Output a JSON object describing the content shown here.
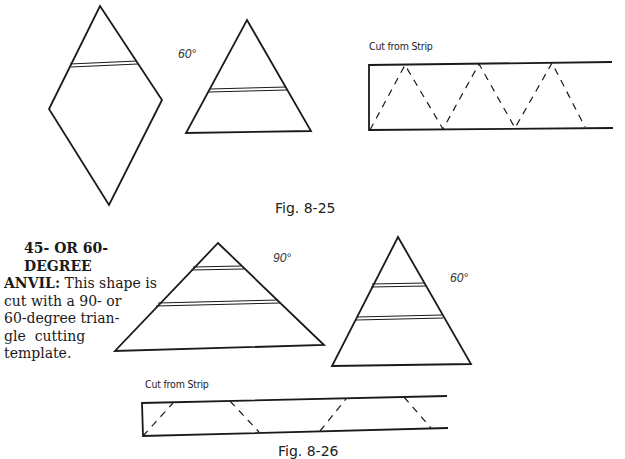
{
  "figure_top": {
    "angle_label": "60°",
    "strip_title": "Cut from Strip",
    "caption": "Fig. 8-25"
  },
  "figure_bottom": {
    "angle_label_left": "90°",
    "angle_label_right": "60°",
    "strip_title": "Cut from Strip",
    "caption": "Fig. 8-26"
  },
  "text": {
    "heading": "45- OR 60-DEGREE",
    "lead": "ANVIL:",
    "line1_rest": " This shape is",
    "line2": "cut with a 90- or",
    "line3": "60-degree trian-",
    "line4": "gle  cutting",
    "line5": "template."
  }
}
